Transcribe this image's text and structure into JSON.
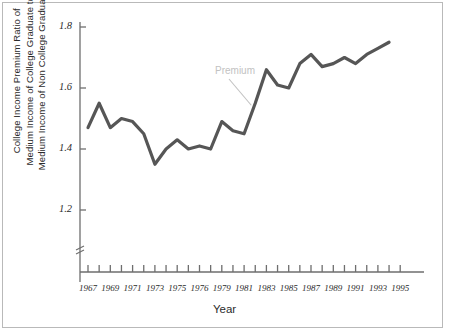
{
  "chart_data": {
    "type": "line",
    "title": "",
    "xlabel": "Year",
    "ylabel": "College Income Premium Ratio of Medium Income of College Graduate to Medium Income of Non College Graduate",
    "ylabel_lines": [
      "College Income Premium Ratio of",
      "Medium Income of College Graduate to",
      "Medium Income of Non College Graduate"
    ],
    "xlim": [
      1967,
      1995
    ],
    "ylim": [
      1.1,
      1.8
    ],
    "yaxis_break": true,
    "grid": false,
    "legend": "none",
    "ytick_labels": [
      "1.2",
      "1.4",
      "1.6",
      "1.8"
    ],
    "ytick_values": [
      1.2,
      1.4,
      1.6,
      1.8
    ],
    "xtick_values": [
      1967,
      1968,
      1969,
      1970,
      1971,
      1972,
      1973,
      1974,
      1975,
      1976,
      1977,
      1978,
      1979,
      1980,
      1981,
      1982,
      1983,
      1984,
      1985,
      1986,
      1987,
      1988,
      1989,
      1990,
      1991,
      1992,
      1993,
      1994,
      1995
    ],
    "xtick_labels_shown": [
      "1967",
      "1969",
      "1971",
      "1973",
      "1975",
      "1976",
      "1979",
      "1981",
      "1983",
      "1985",
      "1987",
      "1989",
      "1991",
      "1993",
      "1995"
    ],
    "xtick_labels_shown_values": [
      1967,
      1969,
      1971,
      1973,
      1975,
      1977,
      1979,
      1981,
      1983,
      1985,
      1987,
      1989,
      1991,
      1993,
      1995
    ],
    "series": [
      {
        "name": "Premium",
        "color": "#565656",
        "x": [
          1967,
          1968,
          1969,
          1970,
          1971,
          1972,
          1973,
          1974,
          1975,
          1976,
          1977,
          1978,
          1979,
          1980,
          1981,
          1982,
          1983,
          1984,
          1985,
          1986,
          1987,
          1988,
          1989,
          1990,
          1991,
          1992,
          1993,
          1994
        ],
        "values": [
          1.47,
          1.55,
          1.47,
          1.5,
          1.49,
          1.45,
          1.35,
          1.4,
          1.43,
          1.4,
          1.41,
          1.4,
          1.49,
          1.46,
          1.45,
          1.55,
          1.66,
          1.61,
          1.6,
          1.68,
          1.71,
          1.67,
          1.68,
          1.7,
          1.68,
          1.71,
          1.73,
          1.75
        ]
      }
    ],
    "annotations": [
      {
        "label": "Premium",
        "color": "#c2c2c2",
        "points_to_x": 1982,
        "points_to_y": 1.55
      }
    ]
  },
  "axis": {
    "x_title": "Year",
    "y_title_line1": "College Income Premium Ratio of",
    "y_title_line2": "Medium Income of College Graduate to",
    "y_title_line3": "Medium Income of Non College Graduate"
  },
  "colors": {
    "line": "#565656",
    "axis": "#6e6e6e",
    "text": "#2b2b2b",
    "annotation": "#c2c2c2",
    "frame": "#b9b9b9",
    "background": "#ffffff"
  }
}
